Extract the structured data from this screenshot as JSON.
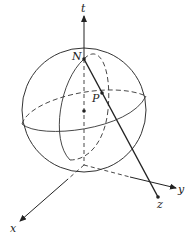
{
  "diagram": {
    "labels": {
      "t_axis": "t",
      "x_axis": "x",
      "y_axis": "y",
      "north_pole": "N",
      "point_on_sphere": "P",
      "projected_point": "z"
    },
    "colors": {
      "stroke": "#333333",
      "background": "#ffffff"
    }
  }
}
